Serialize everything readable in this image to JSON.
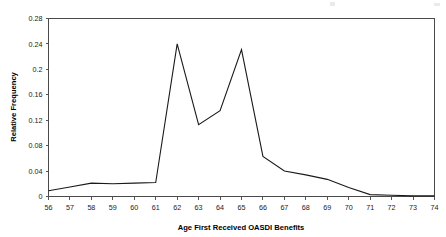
{
  "chart_data": {
    "type": "line",
    "title": "",
    "xlabel": "Age First Received OASDI Benefits",
    "ylabel": "Relative Frequency",
    "xlim": [
      56,
      74
    ],
    "ylim": [
      0,
      0.28
    ],
    "grid": false,
    "legend": null,
    "x": [
      56,
      57,
      58,
      59,
      60,
      61,
      62,
      63,
      64,
      65,
      66,
      67,
      68,
      69,
      70,
      71,
      72,
      73,
      74
    ],
    "xtick_labels": [
      "56",
      "57",
      "58",
      "59",
      "60",
      "61",
      "62",
      "63",
      "64",
      "65",
      "66",
      "67",
      "68",
      "69",
      "70",
      "71",
      "72",
      "73",
      "74"
    ],
    "ytick_values": [
      0,
      0.04,
      0.08,
      0.12,
      0.16,
      0.2,
      0.24,
      0.28
    ],
    "ytick_labels": [
      "0",
      "0.04",
      "0.08",
      "0.12",
      "0.16",
      "0.2",
      "0.24",
      "0.28"
    ],
    "series": [
      {
        "name": "Relative Frequency",
        "color": "#1a1a1a",
        "values": [
          0.009,
          0.015,
          0.021,
          0.02,
          0.021,
          0.022,
          0.24,
          0.113,
          0.135,
          0.231,
          0.063,
          0.04,
          0.034,
          0.027,
          0.014,
          0.003,
          0.002,
          0.001,
          0.001
        ]
      }
    ]
  },
  "figure": {
    "background_color": "#ffffff",
    "line_color": "#1a1a1a",
    "axis_color": "#4a4a4a"
  },
  "artifacts": {
    "top_marks": [
      "scan-speck-left",
      "scan-speck-right"
    ]
  }
}
